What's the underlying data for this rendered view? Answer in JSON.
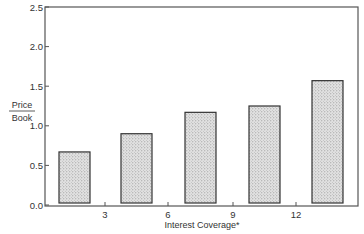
{
  "chart_data": {
    "type": "bar",
    "title": "",
    "xlabel": "Interest Coverage*",
    "ylabel_numerator": "Price",
    "ylabel_denominator": "Book",
    "ylabel": "Price / Book",
    "ylim": [
      0,
      2.5
    ],
    "yticks": [
      "0.0",
      "0.5",
      "1.0",
      "1.5",
      "2.0",
      "2.5"
    ],
    "xticks": [
      "3",
      "6",
      "9",
      "12"
    ],
    "categories": [
      "<3",
      "3-6",
      "6-9",
      "9-12",
      ">12"
    ],
    "values": [
      0.67,
      0.9,
      1.17,
      1.25,
      1.57
    ],
    "grid": false,
    "legend": null,
    "bar_fill": "#cfcfcf",
    "bar_edge": "#333333"
  }
}
